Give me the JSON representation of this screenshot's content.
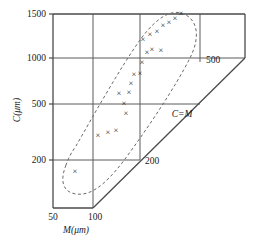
{
  "chart_data": {
    "type": "scatter",
    "title": "",
    "subtitle": "",
    "xlabel": "M(μm)",
    "ylabel": "C(μm)",
    "xlim": [
      50,
      100
    ],
    "ylim": [
      150,
      1500
    ],
    "x_ticks": [
      "50",
      "100"
    ],
    "y_ticks": [
      "1500",
      "1000",
      "500",
      "200"
    ],
    "depth_axis_label": "C=M",
    "depth_ticks": [
      "200",
      "500"
    ],
    "grid": true,
    "legend": "none",
    "marker_symbol": "×",
    "annotations": [
      {
        "name": "envelope",
        "style": "dashed-ellipse",
        "note": "dashed elongated loop enclosing all data points"
      }
    ],
    "points": [
      {
        "M": 78,
        "C": 185
      },
      {
        "M": 84,
        "C": 330
      },
      {
        "M": 87,
        "C": 350
      },
      {
        "M": 89,
        "C": 355
      },
      {
        "M": 92,
        "C": 455
      },
      {
        "M": 92,
        "C": 510
      },
      {
        "M": 90,
        "C": 560
      },
      {
        "M": 93,
        "C": 570
      },
      {
        "M": 93,
        "C": 625
      },
      {
        "M": 94,
        "C": 690
      },
      {
        "M": 96,
        "C": 700
      },
      {
        "M": 96,
        "C": 790
      },
      {
        "M": 98,
        "C": 880
      },
      {
        "M": 99,
        "C": 905
      },
      {
        "M": 101,
        "C": 895
      },
      {
        "M": 97,
        "C": 1010
      },
      {
        "M": 99,
        "C": 1060
      },
      {
        "M": 101,
        "C": 1090
      },
      {
        "M": 103,
        "C": 1150
      },
      {
        "M": 105,
        "C": 1185
      },
      {
        "M": 107,
        "C": 1230
      },
      {
        "M": 109,
        "C": 1295
      }
    ]
  },
  "axes": {
    "y_title": "C(μm)",
    "x_title": "M(μm)",
    "y_tick_1500": "1500",
    "y_tick_1000": "1000",
    "y_tick_500": "500",
    "y_tick_200": "200",
    "x_tick_50": "50",
    "x_tick_100": "100",
    "depth_tick_200": "200",
    "depth_tick_500": "500",
    "depth_label": "C=M"
  },
  "colors": {
    "axis": "#4a4a4a",
    "grid": "#5a5a5a",
    "marker": "#1a1a1a",
    "dashed": "#6a6a6a",
    "background": "#ffffff"
  },
  "markers": [
    {
      "id": "m1",
      "x": 75,
      "y": 171
    },
    {
      "id": "m2",
      "x": 98,
      "y": 135
    },
    {
      "id": "m3",
      "x": 108,
      "y": 132
    },
    {
      "id": "m4",
      "x": 116,
      "y": 130
    },
    {
      "id": "m5",
      "x": 126,
      "y": 113
    },
    {
      "id": "m6",
      "x": 124,
      "y": 103
    },
    {
      "id": "m7",
      "x": 119,
      "y": 93
    },
    {
      "id": "m8",
      "x": 129,
      "y": 92
    },
    {
      "id": "m9",
      "x": 131,
      "y": 83
    },
    {
      "id": "m10",
      "x": 134,
      "y": 74
    },
    {
      "id": "m11",
      "x": 140,
      "y": 73
    },
    {
      "id": "m12",
      "x": 142,
      "y": 62
    },
    {
      "id": "m13",
      "x": 147,
      "y": 52
    },
    {
      "id": "m14",
      "x": 152,
      "y": 49
    },
    {
      "id": "m15",
      "x": 161,
      "y": 50
    },
    {
      "id": "m16",
      "x": 143,
      "y": 39
    },
    {
      "id": "m17",
      "x": 150,
      "y": 34
    },
    {
      "id": "m18",
      "x": 157,
      "y": 31
    },
    {
      "id": "m19",
      "x": 163,
      "y": 25
    },
    {
      "id": "m20",
      "x": 169,
      "y": 22
    },
    {
      "id": "m21",
      "x": 175,
      "y": 18
    },
    {
      "id": "m22",
      "x": 181,
      "y": 13
    }
  ]
}
